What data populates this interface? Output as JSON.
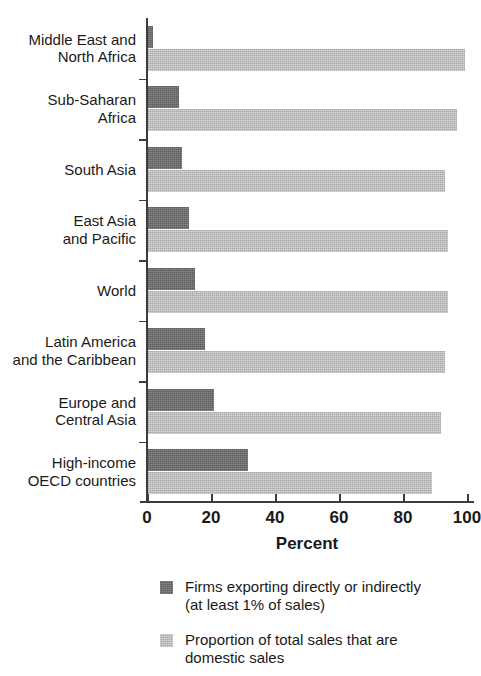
{
  "chart_data": {
    "type": "bar",
    "orientation": "horizontal",
    "title": "",
    "xlabel": "Percent",
    "ylabel": "",
    "xlim": [
      0,
      100
    ],
    "xticks": [
      0,
      20,
      40,
      60,
      80,
      100
    ],
    "xtick_labels": [
      "0",
      "20",
      "40",
      "60",
      "80",
      "100"
    ],
    "grid": false,
    "legend_position": "below",
    "categories": [
      "Middle East and\nNorth Africa",
      "Sub-Saharan\nAfrica",
      "South Asia",
      "East Asia\nand Pacific",
      "World",
      "Latin America\nand the Caribbean",
      "Europe and\nCentral Asia",
      "High-income\nOECD countries"
    ],
    "series": [
      {
        "name": "Firms exporting directly or indirectly\n(at least 1% of sales)",
        "color": "#6b6b6b",
        "values": [
          2,
          10,
          11,
          13,
          15,
          18,
          21,
          31.5
        ]
      },
      {
        "name": "Proportion of total sales that are\ndomestic sales",
        "color": "#bdbdbd",
        "values": [
          99.5,
          97,
          93,
          94,
          94,
          93,
          92,
          89
        ]
      }
    ]
  },
  "axis": {
    "x_title": "Percent",
    "tick_labels": [
      "0",
      "20",
      "40",
      "60",
      "80",
      "100"
    ]
  },
  "legend": {
    "items": [
      {
        "label": "Firms exporting directly or indirectly\n(at least 1% of sales)",
        "color": "#6b6b6b"
      },
      {
        "label": "Proportion of total sales that are\ndomestic sales",
        "color": "#bdbdbd"
      }
    ]
  }
}
